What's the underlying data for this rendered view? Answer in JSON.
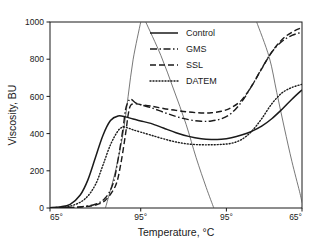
{
  "chart_data": {
    "type": "line",
    "title": "",
    "xlabel": "Temperature, °C",
    "ylabel": "Viscosity, BU",
    "xlim": [
      0,
      100
    ],
    "ylim": [
      0,
      1000
    ],
    "grid": false,
    "legend_position": "top-center",
    "x_tick_labels": [
      "65°",
      "95°",
      "95°",
      "65°"
    ],
    "x_tick_positions": [
      0,
      36,
      70,
      100
    ],
    "y_tick_labels": [
      "0",
      "200",
      "400",
      "600",
      "800",
      "1000"
    ],
    "y_tick_values": [
      0,
      200,
      400,
      600,
      800,
      1000
    ],
    "series": [
      {
        "name": "Control",
        "style": "solid",
        "x": [
          0,
          4,
          8,
          12,
          15,
          18,
          21,
          24,
          27,
          30,
          33,
          36,
          40,
          45,
          50,
          55,
          60,
          64,
          68,
          72,
          76,
          80,
          84,
          88,
          92,
          96,
          100
        ],
        "values": [
          2,
          6,
          20,
          70,
          150,
          270,
          390,
          470,
          495,
          490,
          478,
          468,
          455,
          430,
          405,
          385,
          372,
          368,
          370,
          378,
          392,
          412,
          440,
          480,
          530,
          585,
          635
        ]
      },
      {
        "name": "GMS",
        "style": "dashdot",
        "x": [
          0,
          6,
          12,
          18,
          22,
          25,
          27,
          29,
          30,
          31,
          32,
          34,
          36,
          40,
          45,
          50,
          55,
          60,
          64,
          68,
          72,
          76,
          80,
          84,
          88,
          92,
          96,
          100
        ],
        "values": [
          1,
          2,
          6,
          20,
          55,
          130,
          260,
          430,
          530,
          570,
          585,
          565,
          555,
          540,
          515,
          492,
          475,
          466,
          468,
          480,
          510,
          570,
          655,
          750,
          838,
          895,
          928,
          945
        ]
      },
      {
        "name": "SSL",
        "style": "dashed",
        "x": [
          0,
          6,
          12,
          18,
          22,
          26,
          28,
          30,
          31,
          32,
          34,
          36,
          40,
          45,
          50,
          55,
          60,
          64,
          68,
          72,
          76,
          80,
          84,
          88,
          92,
          96,
          100
        ],
        "values": [
          1,
          2,
          5,
          16,
          42,
          120,
          230,
          400,
          500,
          552,
          560,
          556,
          548,
          535,
          525,
          516,
          511,
          512,
          520,
          540,
          580,
          655,
          748,
          838,
          905,
          945,
          970
        ]
      },
      {
        "name": "DATEM",
        "style": "dotted",
        "x": [
          0,
          4,
          9,
          14,
          18,
          21,
          24,
          27,
          29,
          31,
          33,
          36,
          40,
          45,
          50,
          55,
          60,
          64,
          68,
          72,
          76,
          80,
          84,
          88,
          92,
          96,
          100
        ],
        "values": [
          1,
          4,
          14,
          50,
          125,
          230,
          340,
          415,
          435,
          430,
          420,
          408,
          392,
          372,
          355,
          344,
          340,
          340,
          342,
          348,
          368,
          412,
          480,
          560,
          618,
          648,
          665
        ]
      }
    ],
    "temperature_profile": {
      "description": "Heating, holding and cooling profile arcs drawn as thin reference lines",
      "arcs": [
        {
          "name": "heating-ramp-arc",
          "points": [
            [
              22,
              0
            ],
            [
              26,
              200
            ],
            [
              29,
              400
            ],
            [
              31,
              600
            ],
            [
              33,
              800
            ],
            [
              36,
              1000
            ]
          ]
        },
        {
          "name": "hold-cool-arc",
          "points": [
            [
              38,
              1000
            ],
            [
              44,
              820
            ],
            [
              49,
              640
            ],
            [
              54,
              450
            ],
            [
              58,
              270
            ],
            [
              62,
              110
            ],
            [
              65,
              0
            ]
          ]
        },
        {
          "name": "cooling-arc",
          "points": [
            [
              82,
              1000
            ],
            [
              87,
              810
            ],
            [
              90,
              620
            ],
            [
              93,
              430
            ],
            [
              96,
              250
            ],
            [
              99,
              90
            ],
            [
              100,
              30
            ]
          ]
        }
      ]
    }
  },
  "legend": {
    "entries": [
      {
        "label": "Control",
        "style": "solid"
      },
      {
        "label": "GMS",
        "style": "dashdot"
      },
      {
        "label": "SSL",
        "style": "dashed"
      },
      {
        "label": "DATEM",
        "style": "dotted"
      }
    ]
  },
  "colors": {
    "line": "#1a1a1a",
    "profile_line": "#555555",
    "axis": "#1a1a1a",
    "background": "#ffffff"
  }
}
